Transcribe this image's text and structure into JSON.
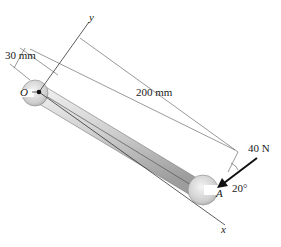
{
  "diagram": {
    "labels": {
      "dim_offset": "30 mm",
      "dim_length": "200 mm",
      "force": "40 N",
      "angle": "20°",
      "point_origin": "O",
      "point_a": "A",
      "axis_x": "x",
      "axis_y": "y"
    },
    "colors": {
      "line": "#333333",
      "wrench_light": "#e6e6e6",
      "wrench_mid": "#c4c4c4",
      "wrench_dark": "#9a9a9a"
    }
  }
}
